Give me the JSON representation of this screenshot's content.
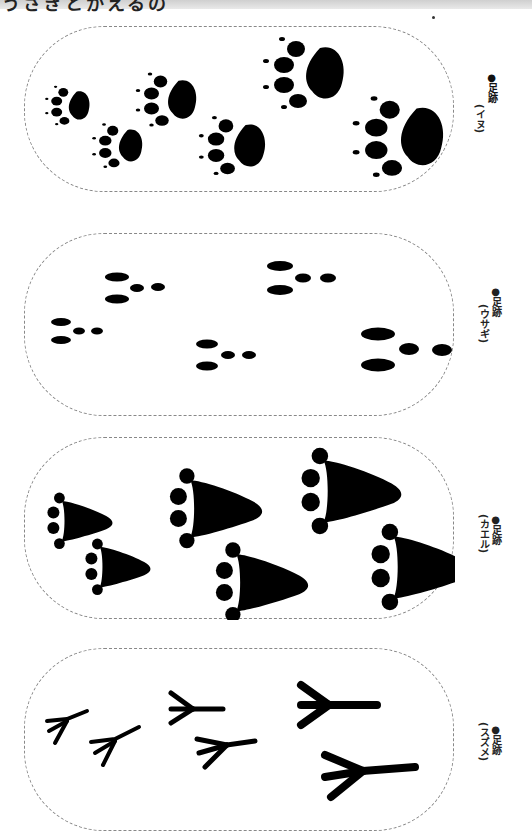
{
  "page": {
    "title_fragment": "うさぎとかえるの",
    "orientation": "rotated-90"
  },
  "cards": [
    {
      "id": "dog",
      "label_prefix": "●足跡",
      "label_name": "(イヌ)",
      "prints": 6
    },
    {
      "id": "rabbit",
      "label_prefix": "●足跡",
      "label_name": "(ウサギ)",
      "prints": 5
    },
    {
      "id": "frog",
      "label_prefix": "●足跡",
      "label_name": "(カエル)",
      "prints": 6
    },
    {
      "id": "sparrow",
      "label_prefix": "●足跡",
      "label_name": "(スズメ)",
      "prints": 6
    }
  ],
  "colors": {
    "ink": "#000000",
    "dash": "#888888",
    "header": "#d8d8d8"
  }
}
